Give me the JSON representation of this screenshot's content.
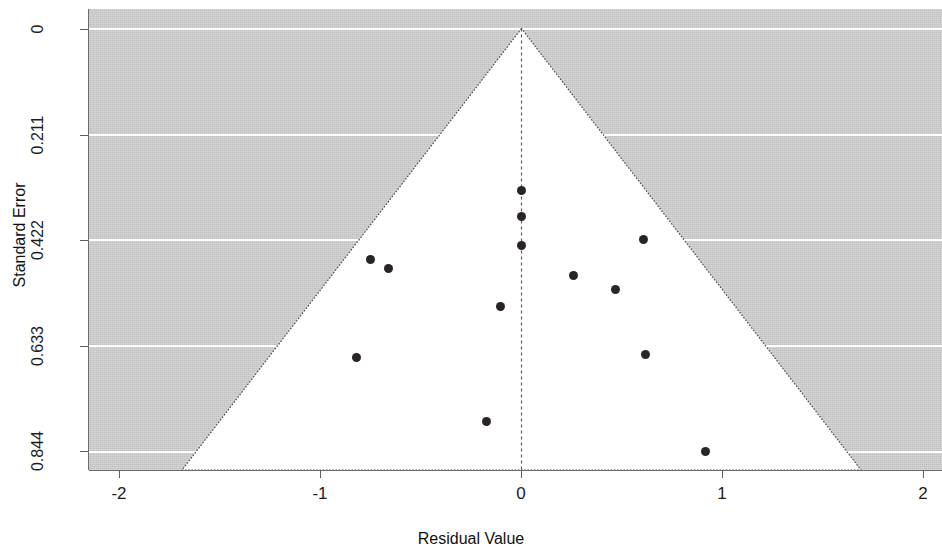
{
  "chart_data": {
    "type": "scatter",
    "title": "",
    "subtitle": "",
    "xlabel": "Residual Value",
    "ylabel": "Standard Error",
    "xlim": [
      -2.15,
      2.09
    ],
    "ylim": [
      0.0,
      0.895
    ],
    "y_inverted": true,
    "grid": "horizontal-white-gridlines",
    "legend": "none",
    "xticks": [
      -2,
      -1,
      0,
      1,
      2
    ],
    "xtick_labels": [
      "-2",
      "-1",
      "0",
      "1",
      "2"
    ],
    "yticks": [
      0,
      0.211,
      0.422,
      0.633,
      0.844
    ],
    "ytick_labels": [
      "0",
      "0.211",
      "0.422",
      "0.633",
      "0.844"
    ],
    "reference_line": {
      "type": "vertical-dashed",
      "x": 0
    },
    "funnel_region": {
      "type": "pseudo-confidence-triangle",
      "apex": {
        "x": 0,
        "y": 0
      },
      "left_base": {
        "x": -1.69,
        "y": 0.844
      },
      "right_base": {
        "x": 1.7,
        "y": 0.844
      },
      "fill": "#ffffff",
      "outside_fill": "#c9c9c9",
      "border": "dotted"
    },
    "series": [
      {
        "name": "studies",
        "marker": "filled-circle",
        "color": "#2b2426",
        "points": [
          {
            "x": 0.0,
            "y": 0.322
          },
          {
            "x": 0.0,
            "y": 0.374
          },
          {
            "x": 0.0,
            "y": 0.432
          },
          {
            "x": -0.75,
            "y": 0.46
          },
          {
            "x": -0.66,
            "y": 0.478
          },
          {
            "x": 0.61,
            "y": 0.42
          },
          {
            "x": 0.26,
            "y": 0.492
          },
          {
            "x": 0.47,
            "y": 0.52
          },
          {
            "x": -0.1,
            "y": 0.554
          },
          {
            "x": -0.82,
            "y": 0.656
          },
          {
            "x": 0.62,
            "y": 0.65
          },
          {
            "x": -0.17,
            "y": 0.784
          },
          {
            "x": 0.92,
            "y": 0.844
          }
        ]
      }
    ]
  },
  "colors": {
    "panel_gray": "#c9c9c9",
    "funnel_white": "#ffffff",
    "point_color": "#2b2426",
    "axis_color": "#6c6c6c",
    "gridline_color": "#ffffff",
    "text_color": "#1c1c1c"
  }
}
